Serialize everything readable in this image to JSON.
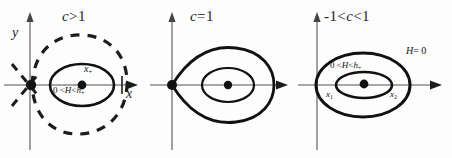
{
  "figure": {
    "type": "phase-portrait-series",
    "background": "#fdfdfd",
    "curve_color": "#111111",
    "axis_color": "#8a8a8a",
    "panels": [
      {
        "id": "panel-1",
        "condition_label": "c > 1",
        "condition_parts": {
          "variable": "c",
          "relation": ">",
          "value": "1"
        },
        "axis_labels": {
          "y": "y",
          "x": "x"
        },
        "features": [
          {
            "name": "saddle-point",
            "label": ""
          },
          {
            "name": "center-point",
            "label": "x+"
          },
          {
            "name": "periodic-orbit-label",
            "label": "0 < H < h+"
          },
          {
            "name": "separatrix",
            "style": "dashed"
          }
        ],
        "center_label": "x",
        "center_label_sub": "+",
        "energy_label_prefix": "0 <",
        "energy_label_H": "H",
        "energy_label_mid": "<",
        "energy_label_h": "h",
        "energy_label_sub": "+"
      },
      {
        "id": "panel-2",
        "condition_label": "c = 1",
        "condition_parts": {
          "variable": "c",
          "relation": "=",
          "value": "1"
        },
        "axis_labels": {
          "y": "",
          "x": ""
        },
        "features": [
          {
            "name": "cusp-point",
            "label": ""
          },
          {
            "name": "homoclinic-loop",
            "style": "solid"
          },
          {
            "name": "center-point",
            "label": ""
          },
          {
            "name": "periodic-orbit",
            "style": "solid"
          }
        ]
      },
      {
        "id": "panel-3",
        "condition_label": "-1 < c < 1",
        "condition_parts": {
          "lower": "-1",
          "relation_1": "<",
          "variable": "c",
          "relation_2": "<",
          "upper": "1"
        },
        "axis_labels": {
          "y": "",
          "x": ""
        },
        "features": [
          {
            "name": "outer-level-curve",
            "label": "H = 0"
          },
          {
            "name": "inner-periodic-orbit",
            "label": "0 < H < h+"
          },
          {
            "name": "center-point",
            "label": ""
          },
          {
            "name": "x1-intercept",
            "label": "x1"
          },
          {
            "name": "x2-intercept",
            "label": "x2"
          }
        ],
        "outer_label_H": "H",
        "outer_label_eq": "= 0",
        "energy_label_prefix": "0 <",
        "energy_label_H": "H",
        "energy_label_mid": "<",
        "energy_label_h": "h",
        "energy_label_sub": "+",
        "x1_label": "x",
        "x1_sub": "1",
        "x2_label": "x",
        "x2_sub": "2"
      }
    ]
  }
}
